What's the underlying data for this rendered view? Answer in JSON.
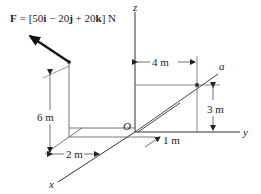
{
  "diagram": {
    "force": {
      "symbol": "F",
      "equation": "= [50",
      "i": "i",
      "minus20": " − 20",
      "j": "j",
      "plus20": " + 20",
      "k": "k",
      "unit": "] N"
    },
    "axes": {
      "x": "x",
      "y": "y",
      "z": "z",
      "origin": "O"
    },
    "line_label": "a",
    "dimensions": {
      "d4": "4 m",
      "d3": "3 m",
      "d6": "6 m",
      "d2": "2 m",
      "d1": "1 m"
    },
    "colors": {
      "line": "#222222",
      "thin": "#555555"
    }
  }
}
